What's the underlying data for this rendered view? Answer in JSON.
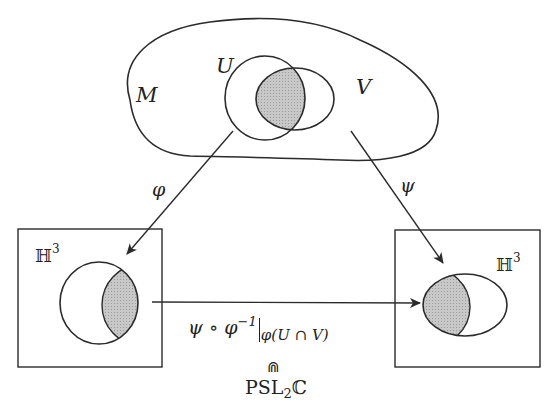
{
  "diagram": {
    "manifold": {
      "label": "M"
    },
    "open_sets": [
      {
        "label": "U"
      },
      {
        "label": "V"
      }
    ],
    "intersection_label": "U ∩ V",
    "charts": [
      {
        "map_label": "φ",
        "target_label": "ℍ",
        "target_exponent": "3",
        "position": "left"
      },
      {
        "map_label": "ψ",
        "target_label": "ℍ",
        "target_exponent": "3",
        "position": "right"
      }
    ],
    "transition": {
      "expr_main": "ψ ∘ φ",
      "expr_exponent": "−1",
      "expr_restriction": "φ(U ∩ V)",
      "membership_symbol": "⋒",
      "group": "PSL",
      "group_sub": "2",
      "group_field": "ℂ"
    },
    "colors": {
      "stroke": "#2b2b2b",
      "shade": "#bdbdbd",
      "background": "#ffffff"
    }
  }
}
